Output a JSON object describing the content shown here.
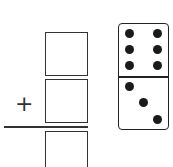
{
  "problem": {
    "operator": "+",
    "boxes": [
      "addend-1",
      "addend-2",
      "sum"
    ],
    "domino": {
      "top_pips": 6,
      "bottom_pips": 3
    }
  }
}
